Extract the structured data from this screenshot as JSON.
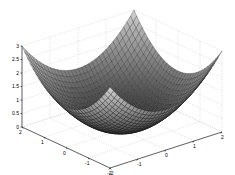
{
  "chart_data": {
    "type": "surface",
    "title": "",
    "xlabel": "",
    "ylabel": "",
    "zlabel": "",
    "function": "z = 3*(x^2 + y^2)/8",
    "x_range": [
      -2,
      2
    ],
    "y_range": [
      -2,
      2
    ],
    "zlim": [
      0,
      3
    ],
    "grid": true,
    "colormap": "gray",
    "mesh_resolution": 33,
    "x_ticks": [
      -2,
      -1,
      0,
      1,
      2
    ],
    "y_ticks": [
      -2,
      -1,
      0,
      1,
      2
    ],
    "z_ticks": [
      0,
      0.5,
      1,
      1.5,
      2,
      2.5,
      3
    ],
    "x_tick_labels": [
      "-2",
      "-1",
      "0",
      "1",
      "2"
    ],
    "y_tick_labels": [
      "-2",
      "-1",
      "0",
      "1",
      "2"
    ],
    "z_tick_labels": [
      "0",
      "0.5",
      "1",
      "1.5",
      "2",
      "2.5",
      "3"
    ],
    "corner_values": {
      "(-2,-2)": 3,
      "(-2,2)": 3,
      "(2,-2)": 3,
      "(2,2)": 3
    },
    "center_value": 0
  },
  "projection": {
    "origin": [
      122,
      129.5
    ],
    "ex": [
      -22,
      -10.25
    ],
    "ey": [
      28,
      -9
    ],
    "ez": [
      0,
      -27
    ]
  },
  "colors": {
    "background": "#ffffff",
    "axis": "#000000",
    "grid": "#c8c8c8",
    "edge": "#111111"
  }
}
